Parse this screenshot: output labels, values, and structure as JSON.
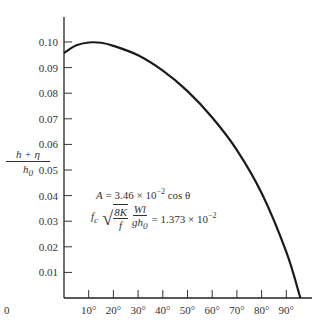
{
  "chart_data": {
    "type": "line",
    "title": "",
    "xlabel": "",
    "ylabel": "(h + η) / h0",
    "ylabel_num": "h + η",
    "ylabel_den": "h",
    "ylabel_den_sub": "0",
    "x_ticks": [
      "0",
      "10°",
      "20°",
      "30°",
      "40°",
      "50°",
      "60°",
      "70°",
      "80°",
      "90°"
    ],
    "y_ticks": [
      "0.01",
      "0.02",
      "0.03",
      "0.04",
      "0.05",
      "0.06",
      "0.07",
      "0.08",
      "0.09",
      "0.10"
    ],
    "xlim": [
      0,
      97
    ],
    "ylim": [
      0,
      0.11
    ],
    "grid": false,
    "series": [
      {
        "name": "(h+η)/h0 vs θ",
        "x": [
          0,
          5,
          10,
          15,
          20,
          30,
          40,
          50,
          60,
          70,
          80,
          90,
          95.7
        ],
        "values": [
          0.0957,
          0.0987,
          0.0998,
          0.0997,
          0.0985,
          0.0948,
          0.0888,
          0.0808,
          0.0705,
          0.0578,
          0.041,
          0.018,
          0.0
        ]
      }
    ],
    "annotations": {
      "line1": {
        "lhs": "A",
        "eq": " = 3.46 × 10",
        "exp": "−2",
        "tail": " cos θ"
      },
      "line2": {
        "f": "f",
        "f_sub": "c",
        "sqrt_num": "8K",
        "sqrt_den": "f",
        "frac_num": "Wl",
        "frac_den": "gh",
        "frac_den_sub": "0",
        "eq": "= 1.373 × 10",
        "exp": "−2"
      }
    }
  }
}
